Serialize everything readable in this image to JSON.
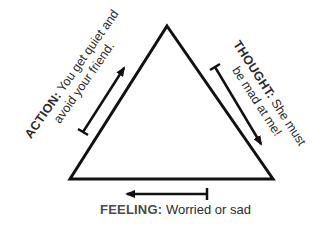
{
  "diagram": {
    "type": "cognitive-triangle",
    "nodes": {
      "action": {
        "heading": "ACTION:",
        "line1_rest": " You get quiet and",
        "line2": "avoid your friend."
      },
      "thought": {
        "heading": "THOUGHT:",
        "line1_rest": " She must",
        "line2": "be mad at me!"
      },
      "feeling": {
        "heading": "FEELING:",
        "text": " Worried or sad"
      }
    },
    "arrows": [
      {
        "from": "action",
        "to": "thought",
        "side": "left",
        "direction": "up-right"
      },
      {
        "from": "thought",
        "to": "feeling",
        "side": "right",
        "direction": "down-right"
      },
      {
        "from": "feeling",
        "to": "action",
        "side": "bottom",
        "direction": "left"
      }
    ],
    "colors": {
      "stroke": "#111111",
      "text": "#2b2b2b",
      "background": "#ffffff"
    }
  }
}
